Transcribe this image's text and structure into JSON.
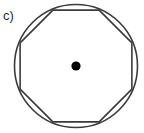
{
  "figure": {
    "panel_label": "c)",
    "label_color": "#2b2b2b",
    "background_color": "#ffffff",
    "stroke_color": "#3a3a3a",
    "dot_color": "#000000",
    "canvas": {
      "width": 144,
      "height": 133
    },
    "circle": {
      "name": "circumscribed-circle",
      "center_x": 76,
      "center_y": 66,
      "radius": 61.5,
      "stroke_width": 1.6,
      "fill": "none"
    },
    "octagon": {
      "name": "inscribed-regular-octagon",
      "sides": 8,
      "center_x": 76,
      "center_y": 66,
      "circumradius": 60.5,
      "rotation_deg": 22.5,
      "stroke_width": 1.6,
      "fill": "none",
      "points": "131.9,89.1 99.1,121.9 52.9,121.9 20.1,89.1 20.1,42.9 52.9,10.1 99.1,10.1 131.9,42.9"
    },
    "center_dot": {
      "name": "center-point-dot",
      "center_x": 76,
      "center_y": 66,
      "radius": 4.6
    }
  }
}
